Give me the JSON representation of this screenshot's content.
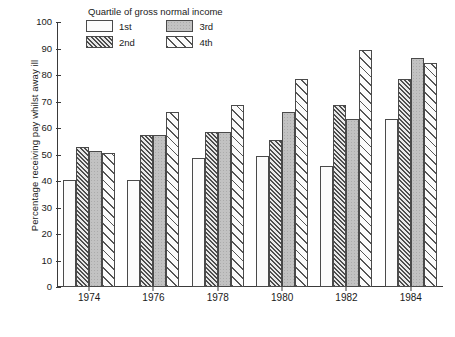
{
  "chart_data": {
    "type": "bar",
    "title": "",
    "xlabel": "",
    "ylabel": "Percentage receiving pay whilst away ill",
    "ylim": [
      0,
      100
    ],
    "yticks": [
      0,
      10,
      20,
      30,
      40,
      50,
      60,
      70,
      80,
      90,
      100
    ],
    "grid": false,
    "legend_title": "Quartile of gross normal income",
    "legend_position": "top-center-inside",
    "categories": [
      "1974",
      "1976",
      "1978",
      "1980",
      "1982",
      "1984"
    ],
    "series": [
      {
        "name": "1st",
        "pattern": "dotted",
        "values": [
          40.5,
          40.5,
          48.5,
          49.5,
          45.5,
          63.5
        ]
      },
      {
        "name": "2nd",
        "pattern": "dense-hatch",
        "values": [
          53.0,
          57.5,
          58.5,
          55.5,
          68.5,
          78.5
        ]
      },
      {
        "name": "3rd",
        "pattern": "solid-gray",
        "values": [
          51.5,
          57.5,
          58.5,
          66.0,
          63.5,
          86.5
        ]
      },
      {
        "name": "4th",
        "pattern": "sparse-hatch",
        "values": [
          50.5,
          66.0,
          68.5,
          78.5,
          89.5,
          84.5
        ]
      }
    ]
  },
  "legend": {
    "title": "Quartile of gross normal income",
    "items": [
      {
        "label": "1st"
      },
      {
        "label": "3rd"
      },
      {
        "label": "2nd"
      },
      {
        "label": "4th"
      }
    ]
  },
  "axes": {
    "y_title": "Percentage receiving pay whilst away ill"
  }
}
